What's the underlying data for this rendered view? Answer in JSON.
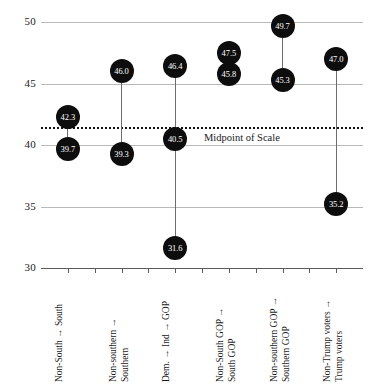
{
  "chart_data": {
    "type": "scatter",
    "title": "",
    "subtitle": "",
    "xlabel": "",
    "ylabel": "",
    "ylim": [
      30,
      50
    ],
    "yticks": [
      30,
      35,
      40,
      45,
      50
    ],
    "grid": true,
    "legend": null,
    "annotations": [
      {
        "text": "Midpoint of Scale",
        "value": 41.5,
        "style": "dotted-horizontal-line"
      }
    ],
    "categories": [
      "Non-South → South",
      "Non-southern → Southern",
      "Dem. → Ind → GOP",
      "Non-South GOP → South GOP",
      "Non-southern GOP → Southern GOP",
      "Non-Trump voters → Trump voters"
    ],
    "category_lines": [
      [
        "Non-South → South"
      ],
      [
        "Non-southern →",
        "Southern"
      ],
      [
        "Dem. → Ind → GOP"
      ],
      [
        "Non-South GOP →",
        "South GOP"
      ],
      [
        "Non-southern GOP →",
        "Southern GOP"
      ],
      [
        "Non-Trump voters →",
        "Trump voters"
      ]
    ],
    "groups": [
      {
        "category": "Non-South → South",
        "values": [
          42.3,
          39.7
        ]
      },
      {
        "category": "Non-southern → Southern",
        "values": [
          46.0,
          39.3
        ]
      },
      {
        "category": "Dem. → Ind → GOP",
        "values": [
          46.4,
          40.5,
          31.6
        ]
      },
      {
        "category": "Non-South GOP → South GOP",
        "values": [
          47.5,
          45.8
        ]
      },
      {
        "category": "Non-southern GOP → Southern GOP",
        "values": [
          49.7,
          45.3
        ]
      },
      {
        "category": "Non-Trump voters → Trump voters",
        "values": [
          47.0,
          35.2
        ]
      }
    ],
    "colors": {
      "marker": "#0d0d0d",
      "marker_label": "#ffffff",
      "gridline": "#b9b9b9",
      "axis": "#5b5b5b",
      "connector": "#6e6e6e",
      "midpoint_line": "#111111",
      "background": "#ffffff"
    }
  }
}
